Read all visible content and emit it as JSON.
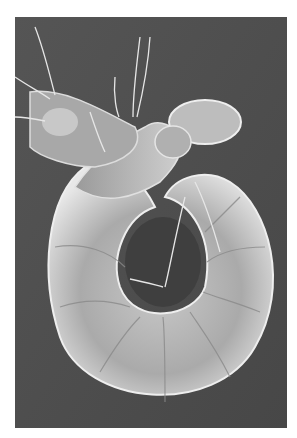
{
  "image": {
    "subject": "scanning electron micrograph of a curled larva",
    "description": "Grayscale SEM image of a C-shaped larva with segmented body, bristles and head capsule on a dark gray background",
    "colors": {
      "background_page": "#ffffff",
      "photo_background": "#4f4f4f",
      "body_highlight": "#e6e6e6",
      "body_mid": "#b4b4b4",
      "body_shadow": "#7a7a7a"
    }
  }
}
